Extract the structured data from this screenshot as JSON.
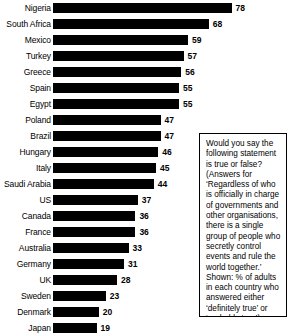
{
  "chart_data": {
    "type": "bar",
    "orientation": "horizontal",
    "title": "",
    "subtitle": "",
    "xlabel": "",
    "ylabel": "",
    "xlim": [
      0,
      78
    ],
    "grid": false,
    "legend": "none",
    "value_suffix": "",
    "categories": [
      "Nigeria",
      "South Africa",
      "Mexico",
      "Turkey",
      "Greece",
      "Spain",
      "Egypt",
      "Poland",
      "Brazil",
      "Hungary",
      "Italy",
      "Saudi Arabia",
      "US",
      "Canada",
      "France",
      "Australia",
      "Germany",
      "UK",
      "Sweden",
      "Denmark",
      "Japan"
    ],
    "values": [
      78,
      68,
      59,
      57,
      56,
      55,
      55,
      47,
      47,
      46,
      45,
      44,
      37,
      36,
      36,
      33,
      31,
      28,
      23,
      20,
      19
    ],
    "bar_color": "#000000",
    "background_color": "#ffffff"
  },
  "note": {
    "text": "Would you say the following statement is true or false? (Answers for ‘Regardless of who is officially in charge of governments and other organisations, there is a single group of people who secretly control events and rule the world together.’ Shown: % of adults in each country who answered either ‘definitely true’ or ‘probably true’)."
  }
}
